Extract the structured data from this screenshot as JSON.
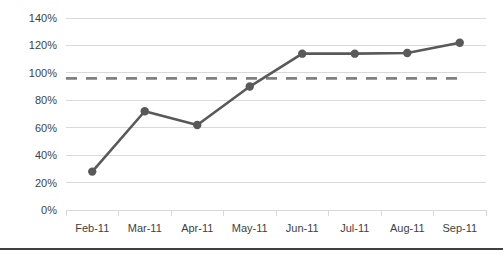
{
  "chart_data": {
    "type": "line",
    "title": "",
    "subtitle": "",
    "xlabel": "",
    "ylabel": "",
    "categories": [
      "Feb-11",
      "Mar-11",
      "Apr-11",
      "May-11",
      "Jun-11",
      "Jul-11",
      "Aug-11",
      "Sep-11"
    ],
    "series": [
      {
        "name": "Actual",
        "values": [
          28,
          72,
          62,
          90,
          114,
          114,
          114.5,
          122
        ],
        "color": "#595959",
        "style": "solid",
        "markers": true
      },
      {
        "name": "Target",
        "values": [
          96,
          96,
          96,
          96,
          96,
          96,
          96,
          96
        ],
        "color": "#808080",
        "style": "dashed",
        "markers": false
      }
    ],
    "ylim": [
      0,
      140
    ],
    "ytick_step": 20,
    "ytick_labels": [
      "0%",
      "20%",
      "40%",
      "60%",
      "80%",
      "100%",
      "120%",
      "140%"
    ],
    "ytick_values": [
      0,
      20,
      40,
      60,
      80,
      100,
      120,
      140
    ],
    "grid": true,
    "grid_axis": "y",
    "grid_color": "#d9d9d9",
    "legend": false,
    "legend_position": "none",
    "plot_background": "#ffffff",
    "annotations": []
  },
  "footer": {
    "rule_color": "#404040"
  }
}
